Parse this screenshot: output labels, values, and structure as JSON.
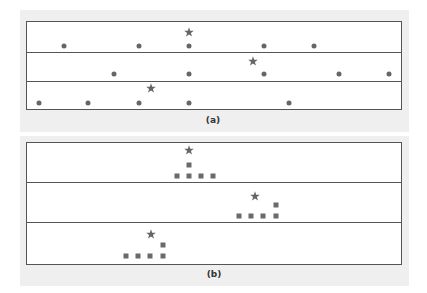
{
  "panels": [
    {
      "caption": "(a)",
      "marker": "dot",
      "rows": [
        {
          "star_x": 189,
          "points_x": [
            64,
            139,
            189,
            264,
            314
          ]
        },
        {
          "star_x": 253,
          "points_x": [
            114,
            189,
            264,
            339,
            389
          ]
        },
        {
          "star_x": 151,
          "points_x": [
            39,
            88,
            139,
            189,
            289
          ]
        }
      ]
    },
    {
      "caption": "(b)",
      "marker": "square",
      "rows": [
        {
          "star_x": 189,
          "squares": [
            {
              "x": 177,
              "level": 0
            },
            {
              "x": 189,
              "level": 0
            },
            {
              "x": 189,
              "level": 1
            },
            {
              "x": 201,
              "level": 0
            },
            {
              "x": 213,
              "level": 0
            }
          ]
        },
        {
          "star_x": 255,
          "squares": [
            {
              "x": 239,
              "level": 0
            },
            {
              "x": 251,
              "level": 0
            },
            {
              "x": 263,
              "level": 0
            },
            {
              "x": 276,
              "level": 0
            },
            {
              "x": 276,
              "level": 1
            }
          ]
        },
        {
          "star_x": 151,
          "squares": [
            {
              "x": 126,
              "level": 0
            },
            {
              "x": 138,
              "level": 0
            },
            {
              "x": 150,
              "level": 0
            },
            {
              "x": 163,
              "level": 0
            },
            {
              "x": 163,
              "level": 1
            }
          ]
        }
      ]
    }
  ],
  "colors": {
    "marker": "#666666",
    "frame": "#555555",
    "panel_bg": "#efefef"
  }
}
